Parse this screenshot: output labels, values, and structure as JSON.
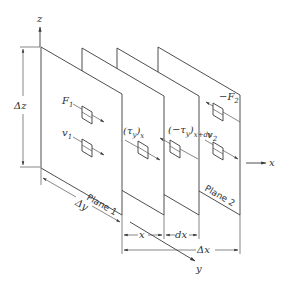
{
  "diagram": {
    "type": "shear-flow-between-planes",
    "axes": {
      "z": "z",
      "x": "x",
      "y": "y"
    },
    "dimensions": {
      "dz": "Δz",
      "dy": "Δy",
      "dx_total": "Δx",
      "x": "x",
      "dx": "dx"
    },
    "planes": [
      {
        "label": "Plane 1"
      },
      {
        "label": "Plane 2"
      }
    ],
    "quantities": {
      "F1": "F",
      "F1_sub": "1",
      "v1": "v",
      "v1_sub": "1",
      "F2": "−F",
      "F2_sub": "2",
      "v2": "v",
      "v2_sub": "2",
      "tau_x": "(τ",
      "tau_x_sub": "y",
      "tau_x_close": ")",
      "tau_x_at": "x",
      "tau_xdx": "(−τ",
      "tau_xdx_sub": "y",
      "tau_xdx_close": ")",
      "tau_xdx_at": "x+dx"
    }
  }
}
